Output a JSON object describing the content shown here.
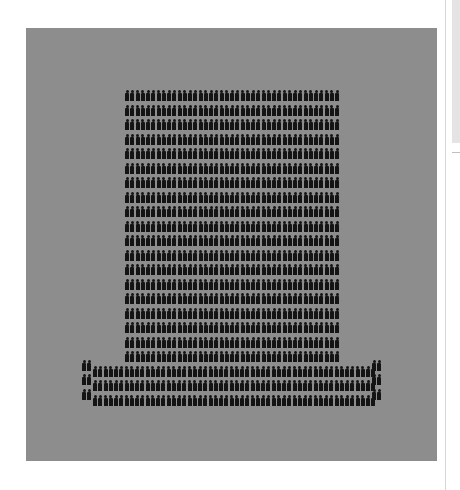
{
  "page": {
    "background": "#ffffff"
  },
  "graphic": {
    "kind": "isotype-pictogram",
    "description": "Rows of person icons arranged in the shape of a top hat",
    "icon": "person-icon",
    "icon_color": "#141414",
    "panel_color": "#8d8d8d",
    "total_icons": 1011,
    "crown": {
      "rows": 19,
      "columns": 41,
      "icons": 779
    },
    "brim": {
      "rows": 3,
      "columns": 54,
      "icons": 162
    },
    "brim_posts": {
      "left": {
        "rows": 3,
        "columns": 2
      },
      "right": {
        "rows": 3,
        "columns": 2
      }
    }
  },
  "scrollbar": {
    "thumb_color": "#e4e4e4"
  }
}
